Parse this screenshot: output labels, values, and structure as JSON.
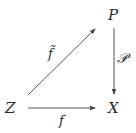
{
  "diagram": {
    "type": "commutative-diagram",
    "nodes": {
      "P": "P",
      "Z": "Z",
      "X": "X"
    },
    "edges": {
      "lift": {
        "from": "Z",
        "to": "P",
        "label": "f̃"
      },
      "projection": {
        "from": "P",
        "to": "X",
        "label": "𝒫"
      },
      "map": {
        "from": "Z",
        "to": "X",
        "label": "f"
      }
    },
    "colors": {
      "stroke": "#444444",
      "text": "#2a2a2a",
      "background": "#ffffff"
    }
  }
}
